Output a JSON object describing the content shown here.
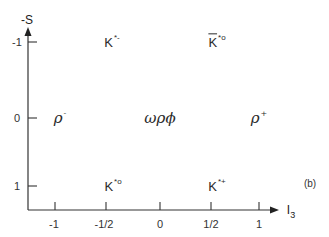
{
  "diagram": {
    "type": "meson-multiplet-weight-diagram",
    "panel_label": "(b)",
    "axes": {
      "x": {
        "title": "I",
        "title_sub": "3",
        "ticks": [
          "-1",
          "-1/2",
          "0",
          "1/2",
          "1"
        ]
      },
      "y": {
        "title": "-S",
        "ticks": [
          "-1",
          "0",
          "1"
        ]
      }
    },
    "states": [
      {
        "id": "k-star-minus",
        "base": "K",
        "sup": "*-",
        "I3": "-1/2",
        "minusS": "-1"
      },
      {
        "id": "kbar-star-zero",
        "base": "K",
        "bar": true,
        "sup": "*o",
        "I3": "1/2",
        "minusS": "-1"
      },
      {
        "id": "rho-minus",
        "base": "ρ",
        "sup": "-",
        "I3": "-1",
        "minusS": "0"
      },
      {
        "id": "omega-rho-phi",
        "base": "ωρϕ",
        "sup": "",
        "I3": "0",
        "minusS": "0"
      },
      {
        "id": "rho-plus",
        "base": "ρ",
        "sup": "+",
        "I3": "1",
        "minusS": "0"
      },
      {
        "id": "k-star-zero",
        "base": "K",
        "sup": "*o",
        "I3": "-1/2",
        "minusS": "1"
      },
      {
        "id": "k-star-plus",
        "base": "K",
        "sup": "*+",
        "I3": "1/2",
        "minusS": "1"
      }
    ],
    "colors": {
      "ink": "#2a2a2a",
      "background": "#ffffff"
    }
  }
}
